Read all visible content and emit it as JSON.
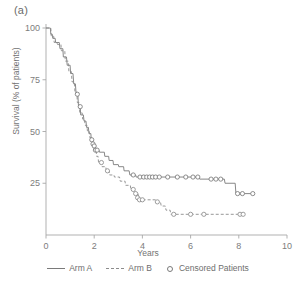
{
  "figure": {
    "panel_label": "(a)"
  },
  "chart_data": {
    "type": "line",
    "title": "",
    "subtitle": "",
    "xlabel": "Years",
    "ylabel": "Survival (% of patients)",
    "xlim": [
      0,
      10
    ],
    "ylim": [
      0,
      100
    ],
    "xticks": [
      0,
      2,
      4,
      6,
      8,
      10
    ],
    "xtick_labels": [
      "0",
      "2",
      "4",
      "6",
      "8",
      "10"
    ],
    "yticks": [
      25,
      50,
      75,
      100
    ],
    "ytick_labels": [
      "25",
      "50",
      "75",
      "100"
    ],
    "grid": false,
    "legend_position": "bottom",
    "colors": {
      "arm_a": "#7a7a7a",
      "arm_b": "#8c8c8c",
      "axis": "#a8a8a8",
      "text": "#6e6e6e"
    },
    "series": [
      {
        "name": "Arm A",
        "style": "solid",
        "points": [
          [
            0.0,
            100
          ],
          [
            0.18,
            100
          ],
          [
            0.2,
            97
          ],
          [
            0.26,
            97
          ],
          [
            0.28,
            95
          ],
          [
            0.38,
            95
          ],
          [
            0.4,
            93
          ],
          [
            0.55,
            93
          ],
          [
            0.58,
            90
          ],
          [
            0.7,
            90
          ],
          [
            0.72,
            86
          ],
          [
            0.85,
            86
          ],
          [
            0.88,
            82
          ],
          [
            1.0,
            82
          ],
          [
            1.02,
            78
          ],
          [
            1.12,
            78
          ],
          [
            1.15,
            73
          ],
          [
            1.22,
            73
          ],
          [
            1.25,
            68
          ],
          [
            1.32,
            68
          ],
          [
            1.35,
            62
          ],
          [
            1.42,
            62
          ],
          [
            1.44,
            58
          ],
          [
            1.55,
            58
          ],
          [
            1.58,
            55
          ],
          [
            1.66,
            55
          ],
          [
            1.68,
            52
          ],
          [
            1.76,
            52
          ],
          [
            1.78,
            49
          ],
          [
            1.86,
            49
          ],
          [
            1.88,
            46
          ],
          [
            1.94,
            46
          ],
          [
            1.96,
            43
          ],
          [
            2.02,
            43
          ],
          [
            2.04,
            41
          ],
          [
            2.2,
            41
          ],
          [
            2.22,
            40
          ],
          [
            2.42,
            40
          ],
          [
            2.44,
            38
          ],
          [
            2.6,
            38
          ],
          [
            2.62,
            36
          ],
          [
            2.78,
            36
          ],
          [
            2.8,
            34
          ],
          [
            3.0,
            34
          ],
          [
            3.02,
            33
          ],
          [
            3.22,
            33
          ],
          [
            3.24,
            31
          ],
          [
            3.45,
            31
          ],
          [
            3.48,
            29
          ],
          [
            3.72,
            29
          ],
          [
            3.74,
            28
          ],
          [
            6.35,
            28
          ],
          [
            6.38,
            27
          ],
          [
            7.4,
            27
          ],
          [
            7.43,
            25
          ],
          [
            7.85,
            25
          ],
          [
            7.88,
            20
          ],
          [
            8.62,
            20
          ]
        ],
        "censored": [
          [
            1.3,
            68
          ],
          [
            1.42,
            62
          ],
          [
            1.9,
            46
          ],
          [
            1.95,
            44
          ],
          [
            2.0,
            43
          ],
          [
            2.05,
            41
          ],
          [
            2.12,
            41
          ],
          [
            3.62,
            29
          ],
          [
            3.9,
            28
          ],
          [
            4.05,
            28
          ],
          [
            4.18,
            28
          ],
          [
            4.3,
            28
          ],
          [
            4.42,
            28
          ],
          [
            4.55,
            28
          ],
          [
            4.7,
            28
          ],
          [
            5.05,
            28
          ],
          [
            5.45,
            28
          ],
          [
            5.8,
            28
          ],
          [
            6.1,
            28
          ],
          [
            6.3,
            28
          ],
          [
            6.85,
            27
          ],
          [
            7.05,
            27
          ],
          [
            7.25,
            27
          ],
          [
            7.95,
            20
          ],
          [
            8.15,
            20
          ],
          [
            8.58,
            20
          ]
        ]
      },
      {
        "name": "Arm B",
        "style": "dashed",
        "points": [
          [
            0.0,
            100
          ],
          [
            0.2,
            100
          ],
          [
            0.22,
            96
          ],
          [
            0.32,
            96
          ],
          [
            0.34,
            93
          ],
          [
            0.45,
            93
          ],
          [
            0.48,
            92
          ],
          [
            0.62,
            92
          ],
          [
            0.64,
            89
          ],
          [
            0.78,
            89
          ],
          [
            0.8,
            84
          ],
          [
            0.92,
            84
          ],
          [
            0.95,
            79
          ],
          [
            1.05,
            79
          ],
          [
            1.08,
            74
          ],
          [
            1.18,
            74
          ],
          [
            1.2,
            69
          ],
          [
            1.28,
            69
          ],
          [
            1.3,
            64
          ],
          [
            1.38,
            64
          ],
          [
            1.4,
            59
          ],
          [
            1.5,
            59
          ],
          [
            1.52,
            56
          ],
          [
            1.6,
            56
          ],
          [
            1.62,
            53
          ],
          [
            1.7,
            53
          ],
          [
            1.72,
            50
          ],
          [
            1.8,
            50
          ],
          [
            1.82,
            47
          ],
          [
            1.9,
            47
          ],
          [
            1.92,
            44
          ],
          [
            1.98,
            44
          ],
          [
            2.0,
            41
          ],
          [
            2.08,
            41
          ],
          [
            2.1,
            38
          ],
          [
            2.16,
            38
          ],
          [
            2.18,
            35
          ],
          [
            2.3,
            35
          ],
          [
            2.32,
            33
          ],
          [
            2.48,
            33
          ],
          [
            2.5,
            31
          ],
          [
            2.62,
            31
          ],
          [
            2.64,
            29
          ],
          [
            2.82,
            29
          ],
          [
            2.84,
            28
          ],
          [
            3.05,
            28
          ],
          [
            3.08,
            26
          ],
          [
            3.28,
            26
          ],
          [
            3.3,
            24
          ],
          [
            3.5,
            24
          ],
          [
            3.52,
            22
          ],
          [
            3.68,
            22
          ],
          [
            3.7,
            20
          ],
          [
            3.82,
            20
          ],
          [
            3.85,
            17
          ],
          [
            4.55,
            17
          ],
          [
            4.58,
            16
          ],
          [
            4.75,
            16
          ],
          [
            4.78,
            14
          ],
          [
            4.95,
            14
          ],
          [
            4.98,
            12
          ],
          [
            5.15,
            12
          ],
          [
            5.18,
            10
          ],
          [
            8.2,
            10
          ]
        ],
        "censored": [
          [
            2.3,
            35
          ],
          [
            2.55,
            31
          ],
          [
            3.62,
            22
          ],
          [
            3.72,
            20
          ],
          [
            3.8,
            18
          ],
          [
            3.88,
            17
          ],
          [
            4.0,
            17
          ],
          [
            4.62,
            16
          ],
          [
            5.3,
            10
          ],
          [
            6.0,
            10
          ],
          [
            6.55,
            10
          ],
          [
            8.05,
            10
          ],
          [
            8.18,
            10
          ]
        ]
      }
    ]
  },
  "legend": {
    "items": [
      {
        "label": "Arm A",
        "marker": "solid-line"
      },
      {
        "label": "Arm B",
        "marker": "dashed-line"
      },
      {
        "label": "Censored Patients",
        "marker": "circle"
      }
    ]
  }
}
